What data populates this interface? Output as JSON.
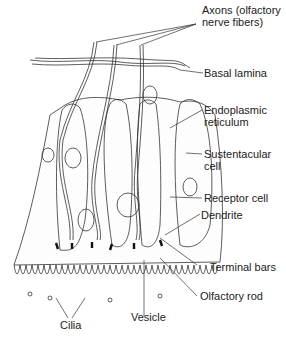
{
  "figure": {
    "labels": {
      "axons": "Axons (olfactory\nnerve fibers)",
      "basal_lamina": "Basal lamina",
      "endoplasmic_reticulum": "Endoplasmic\nreticulum",
      "sustentacular_cell": "Sustentacular\ncell",
      "receptor_cell": "Receptor cell",
      "dendrite": "Dendrite",
      "terminal_bars": "Terminal bars",
      "olfactory_rod": "Olfactory rod",
      "cilia": "Cilia",
      "vesicle": "Vesicle"
    },
    "colors": {
      "line": "#333333",
      "background": "#ffffff",
      "stipple": "#cccccc"
    }
  }
}
